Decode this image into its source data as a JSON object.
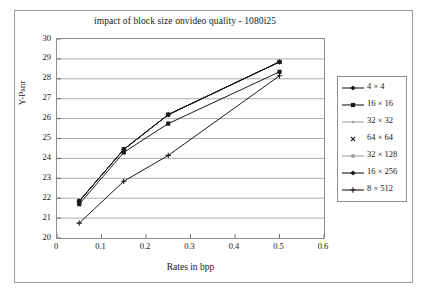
{
  "chart_data": {
    "type": "line",
    "title": "impact of block size onvideo quality - 1080i25",
    "xlabel": "Rates in bpp",
    "ylabel": "Y-Psnr",
    "xlim": [
      0,
      0.6
    ],
    "ylim": [
      20,
      30
    ],
    "xticks": [
      "0",
      "0.1",
      "0.2",
      "0.3",
      "0.4",
      "0.5",
      "0.6"
    ],
    "xtick_values": [
      0,
      0.1,
      0.2,
      0.3,
      0.4,
      0.5,
      0.6
    ],
    "yticks": [
      "20",
      "21",
      "22",
      "23",
      "24",
      "25",
      "26",
      "27",
      "28",
      "29",
      "30"
    ],
    "ytick_values": [
      20,
      21,
      22,
      23,
      24,
      25,
      26,
      27,
      28,
      29,
      30
    ],
    "grid": "horizontal",
    "legend_position": "right",
    "x": [
      0.05,
      0.15,
      0.25,
      0.5
    ],
    "series": [
      {
        "name": "4 × 4",
        "marker": "diamond",
        "color": "#1a1a1a",
        "values": [
          21.85,
          24.45,
          26.2,
          28.85
        ]
      },
      {
        "name": "16 × 16",
        "marker": "square",
        "color": "#1a1a1a",
        "values": [
          21.7,
          24.3,
          25.75,
          28.35
        ]
      },
      {
        "name": "32 × 32",
        "marker": "line-light",
        "color": "#9d9d9d",
        "values": [
          21.85,
          24.45,
          26.2,
          28.85
        ]
      },
      {
        "name": "64 × 64",
        "marker": "cross",
        "color": "#1a1a1a",
        "values": [
          21.85,
          24.45,
          26.2,
          28.85
        ]
      },
      {
        "name": "32 × 128",
        "marker": "circle-light",
        "color": "#9d9d9d",
        "values": [
          21.85,
          24.45,
          26.2,
          28.85
        ]
      },
      {
        "name": "16 × 256",
        "marker": "diamond-filled",
        "color": "#1a1a1a",
        "values": [
          21.85,
          24.45,
          26.2,
          28.85
        ]
      },
      {
        "name": "8 × 512",
        "marker": "plus",
        "color": "#1a1a1a",
        "values": [
          20.75,
          22.85,
          24.15,
          28.15
        ]
      }
    ]
  }
}
